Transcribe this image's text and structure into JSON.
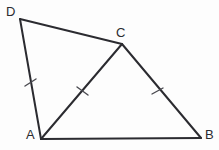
{
  "figure": {
    "kind": "geometry-diagram",
    "background_color": "#fdfdfd",
    "stroke_color": "#2b2b30",
    "tick_color": "#4a4a50",
    "label_color": "#2b2b30"
  },
  "vertices": [
    {
      "name": "A",
      "label": "A",
      "x": 41,
      "y": 139,
      "label_x": 26,
      "label_y": 128
    },
    {
      "name": "B",
      "label": "B",
      "x": 201,
      "y": 138,
      "label_x": 205,
      "label_y": 128
    },
    {
      "name": "C",
      "label": "C",
      "x": 122,
      "y": 44,
      "label_x": 116,
      "label_y": 26
    },
    {
      "name": "D",
      "label": "D",
      "x": 20,
      "y": 19,
      "label_x": 6,
      "label_y": 5
    }
  ],
  "edges": [
    {
      "name": "segment-DC",
      "from": "D",
      "to": "C",
      "path": "M 20 19 L 122 44"
    },
    {
      "name": "segment-DA",
      "from": "D",
      "to": "A",
      "path": "M 20 19 L 41 139"
    },
    {
      "name": "segment-AB",
      "from": "A",
      "to": "B",
      "path": "M 41 139 L 201 138"
    },
    {
      "name": "segment-CB",
      "from": "C",
      "to": "B",
      "path": "M 122 44 L 201 138"
    },
    {
      "name": "segment-AC",
      "from": "A",
      "to": "C",
      "path": "M 41 139 L 122 44"
    }
  ],
  "tick_marks": [
    {
      "name": "tick-on-DA",
      "on_segment": "segment-DA",
      "count": 1,
      "path": "M 25 86 L 36 79"
    },
    {
      "name": "tick-on-AC",
      "on_segment": "segment-AC",
      "count": 1,
      "path": "M 77 87 L 88 95"
    },
    {
      "name": "tick-on-CB",
      "on_segment": "segment-CB",
      "count": 1,
      "path": "M 152 94 L 163 88"
    }
  ]
}
